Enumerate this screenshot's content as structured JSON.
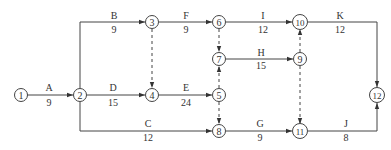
{
  "diagram": {
    "type": "activity-on-arrow network",
    "nodes": [
      {
        "id": "1",
        "label": "1",
        "x": 21,
        "y": 95
      },
      {
        "id": "2",
        "label": "2",
        "x": 80,
        "y": 95
      },
      {
        "id": "3",
        "label": "3",
        "x": 152,
        "y": 22
      },
      {
        "id": "4",
        "label": "4",
        "x": 152,
        "y": 95
      },
      {
        "id": "5",
        "label": "5",
        "x": 219,
        "y": 95
      },
      {
        "id": "6",
        "label": "6",
        "x": 219,
        "y": 22
      },
      {
        "id": "7",
        "label": "7",
        "x": 219,
        "y": 59
      },
      {
        "id": "8",
        "label": "8",
        "x": 219,
        "y": 131
      },
      {
        "id": "9",
        "label": "9",
        "x": 300,
        "y": 59
      },
      {
        "id": "10",
        "label": "10",
        "x": 300,
        "y": 22
      },
      {
        "id": "11",
        "label": "11",
        "x": 300,
        "y": 131
      },
      {
        "id": "12",
        "label": "12",
        "x": 377,
        "y": 95
      }
    ],
    "activities": [
      {
        "name": "A",
        "duration": "9",
        "from": "1",
        "to": "2"
      },
      {
        "name": "B",
        "duration": "9",
        "from": "2",
        "to": "3"
      },
      {
        "name": "C",
        "duration": "12",
        "from": "2",
        "to": "8"
      },
      {
        "name": "D",
        "duration": "15",
        "from": "2",
        "to": "4"
      },
      {
        "name": "E",
        "duration": "24",
        "from": "4",
        "to": "5"
      },
      {
        "name": "F",
        "duration": "9",
        "from": "3",
        "to": "6"
      },
      {
        "name": "G",
        "duration": "9",
        "from": "8",
        "to": "11"
      },
      {
        "name": "H",
        "duration": "15",
        "from": "7",
        "to": "9"
      },
      {
        "name": "I",
        "duration": "12",
        "from": "6",
        "to": "10"
      },
      {
        "name": "J",
        "duration": "8",
        "from": "11",
        "to": "12"
      },
      {
        "name": "K",
        "duration": "12",
        "from": "10",
        "to": "12"
      }
    ],
    "dummy_activities": [
      {
        "from": "3",
        "to": "4"
      },
      {
        "from": "6",
        "to": "7"
      },
      {
        "from": "5",
        "to": "7"
      },
      {
        "from": "5",
        "to": "8"
      },
      {
        "from": "9",
        "to": "10"
      },
      {
        "from": "9",
        "to": "11"
      }
    ]
  }
}
